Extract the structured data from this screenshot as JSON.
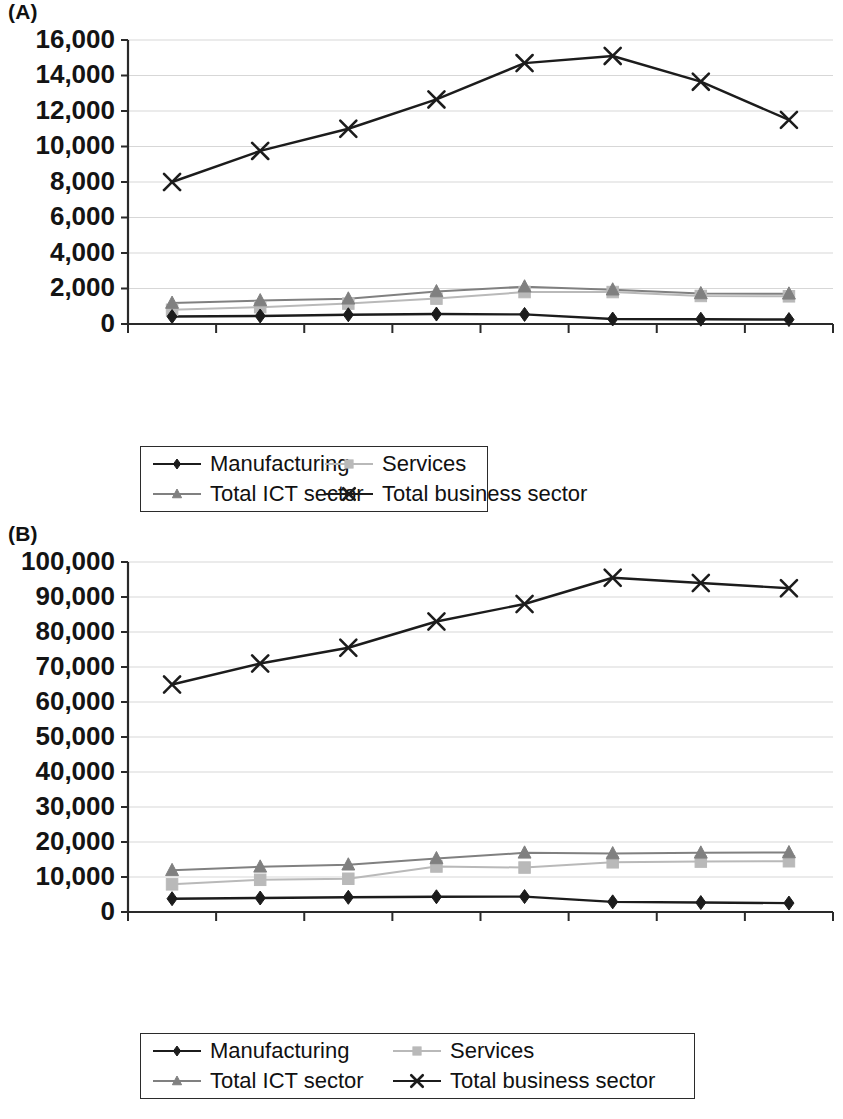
{
  "panels": [
    {
      "id": "A",
      "label": "(A)"
    },
    {
      "id": "B",
      "label": "(B)"
    }
  ],
  "legend": {
    "entries": [
      {
        "label": "Manufacturing",
        "marker": "diamond-marker",
        "color": "#1c1c1c"
      },
      {
        "label": "Services",
        "marker": "square-marker",
        "color": "#b9b9b9"
      },
      {
        "label": "Total ICT sector",
        "marker": "triangle-marker",
        "color": "#808080"
      },
      {
        "label": "Total business sector",
        "marker": "cross-marker",
        "color": "#1c1c1c"
      }
    ]
  },
  "chart_data": [
    {
      "type": "line",
      "title": "(A)",
      "xlabel": "",
      "ylabel": "",
      "categories": [
        "2003",
        "2004",
        "2005",
        "2006",
        "2007",
        "2008",
        "2009",
        "2010"
      ],
      "ylim": [
        0,
        16000
      ],
      "yticks": [
        0,
        2000,
        4000,
        6000,
        8000,
        10000,
        12000,
        14000,
        16000
      ],
      "ytick_labels": [
        "0",
        "2,000",
        "4,000",
        "6,000",
        "8,000",
        "10,000",
        "12,000",
        "14,000",
        "16,000"
      ],
      "grid": true,
      "legend_position": "bottom",
      "series": [
        {
          "name": "Manufacturing",
          "marker": "diamond",
          "color": "#1c1c1c",
          "values": [
            420,
            450,
            520,
            560,
            540,
            280,
            270,
            250
          ]
        },
        {
          "name": "Services",
          "marker": "square",
          "color": "#b9b9b9",
          "values": [
            800,
            950,
            1150,
            1430,
            1800,
            1800,
            1580,
            1560
          ]
        },
        {
          "name": "Total ICT sector",
          "marker": "triangle",
          "color": "#808080",
          "values": [
            1180,
            1320,
            1420,
            1830,
            2100,
            1930,
            1720,
            1700
          ]
        },
        {
          "name": "Total business sector",
          "marker": "cross",
          "color": "#1c1c1c",
          "values": [
            8000,
            9750,
            11000,
            12650,
            14700,
            15100,
            13650,
            11500
          ]
        }
      ]
    },
    {
      "type": "line",
      "title": "(B)",
      "xlabel": "",
      "ylabel": "",
      "categories": [
        "2003",
        "2004",
        "2005",
        "2006",
        "2007",
        "2008",
        "2009",
        "2010"
      ],
      "ylim": [
        0,
        100000
      ],
      "yticks": [
        0,
        10000,
        20000,
        30000,
        40000,
        50000,
        60000,
        70000,
        80000,
        90000,
        100000
      ],
      "ytick_labels": [
        "0",
        "10,000",
        "20,000",
        "30,000",
        "40,000",
        "50,000",
        "60,000",
        "70,000",
        "80,000",
        "90,000",
        "100,000"
      ],
      "grid": true,
      "legend_position": "bottom",
      "series": [
        {
          "name": "Manufacturing",
          "marker": "diamond",
          "color": "#1c1c1c",
          "values": [
            3800,
            4000,
            4200,
            4350,
            4400,
            2900,
            2700,
            2550
          ]
        },
        {
          "name": "Services",
          "marker": "square",
          "color": "#b9b9b9",
          "values": [
            7900,
            9200,
            9500,
            13000,
            12700,
            14200,
            14400,
            14500
          ]
        },
        {
          "name": "Total ICT sector",
          "marker": "triangle",
          "color": "#808080",
          "values": [
            11900,
            12900,
            13500,
            15300,
            16900,
            16700,
            16900,
            17000
          ]
        },
        {
          "name": "Total business sector",
          "marker": "cross",
          "color": "#1c1c1c",
          "values": [
            65000,
            71000,
            75500,
            83000,
            88000,
            95500,
            94000,
            92500
          ]
        }
      ]
    }
  ]
}
